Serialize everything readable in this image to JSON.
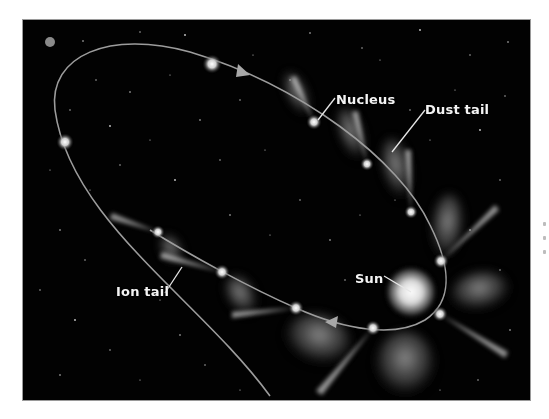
{
  "diagram": {
    "labels": {
      "nucleus": "Nucleus",
      "dust_tail": "Dust tail",
      "ion_tail": "Ion tail",
      "sun": "Sun"
    },
    "colors": {
      "background": "#020202",
      "orbit": "#9c9c9c",
      "label_text": "#f4f4f4",
      "leader_line": "#e6e6e6",
      "page": "#ffffff"
    },
    "icons": {
      "direction_arrow": "triangle-arrow",
      "sun": "glowing-disc",
      "comet": "glowing-nucleus"
    }
  }
}
